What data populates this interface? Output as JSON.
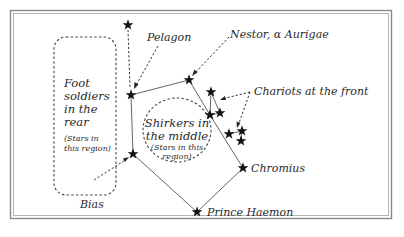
{
  "diagram": {
    "colors": {
      "star": "#111111",
      "text": "#2a2a2a",
      "frame": "#8a8a8a",
      "lines": "#555555"
    },
    "labels": {
      "pelagon": "Pelagon",
      "nestor": "Nestor, α Aurigae",
      "chariots": "Chariots at the front",
      "chromius": "Chromius",
      "prince_haemon": "Prince Haemon",
      "bias": "Bias"
    },
    "regions": {
      "rear": {
        "line1": "Foot",
        "line2": "soldiers",
        "line3": "in the",
        "line4": "rear",
        "note1": "(Stars in",
        "note2": "this region)"
      },
      "middle": {
        "line1": "Shirkers in",
        "line2": "the middle",
        "note1": "(Stars in this",
        "note2": "region)"
      }
    },
    "stars": [
      {
        "id": "top",
        "x": 128,
        "y": 25
      },
      {
        "id": "pelagon",
        "x": 131,
        "y": 95
      },
      {
        "id": "nestor",
        "x": 189,
        "y": 80
      },
      {
        "id": "chariot-a",
        "x": 211,
        "y": 92
      },
      {
        "id": "chariot-b",
        "x": 210,
        "y": 115
      },
      {
        "id": "chariot-c",
        "x": 220,
        "y": 113
      },
      {
        "id": "chariot-d",
        "x": 229,
        "y": 134
      },
      {
        "id": "chariot-e",
        "x": 242,
        "y": 131
      },
      {
        "id": "chariot-f",
        "x": 241,
        "y": 141
      },
      {
        "id": "bias",
        "x": 133,
        "y": 154
      },
      {
        "id": "chromius",
        "x": 243,
        "y": 168
      },
      {
        "id": "prince-haemon",
        "x": 197,
        "y": 212
      }
    ]
  }
}
